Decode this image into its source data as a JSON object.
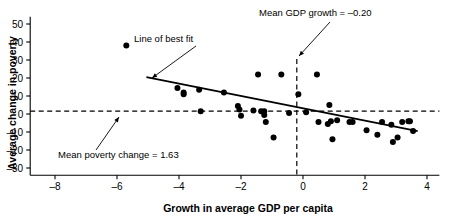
{
  "chart_data": {
    "type": "scatter",
    "title": "",
    "xlabel": "Growth in average GDP  per capita",
    "ylabel": "Average change in poverty",
    "xlim": [
      -8.8,
      4.4
    ],
    "ylim": [
      -34,
      54
    ],
    "xticks": [
      -8,
      -6,
      -4,
      -2,
      0,
      2,
      4
    ],
    "xtick_labels": [
      "–8",
      "–6",
      "–4",
      "–2",
      "0",
      "2",
      "4"
    ],
    "yticks": [
      -30,
      -20,
      -10,
      0,
      10,
      20,
      30,
      40,
      50
    ],
    "ytick_labels": [
      "–30",
      "–20",
      "–10",
      "0",
      "10",
      "20",
      "30",
      "40",
      "50"
    ],
    "grid": false,
    "legend": "none",
    "point_color": "#000000",
    "line_color": "#000000",
    "points": [
      {
        "x": -5.7,
        "y": 38.0
      },
      {
        "x": -4.05,
        "y": 14.5
      },
      {
        "x": -3.85,
        "y": 12.0
      },
      {
        "x": -3.85,
        "y": 11.0
      },
      {
        "x": -3.35,
        "y": 13.5
      },
      {
        "x": -3.3,
        "y": 1.5
      },
      {
        "x": -2.55,
        "y": 12.0
      },
      {
        "x": -2.1,
        "y": 4.5
      },
      {
        "x": -2.05,
        "y": 2.5
      },
      {
        "x": -2.0,
        "y": -1.0
      },
      {
        "x": -1.6,
        "y": 2.0
      },
      {
        "x": -1.45,
        "y": 22.0
      },
      {
        "x": -1.35,
        "y": 1.5
      },
      {
        "x": -1.25,
        "y": 1.5
      },
      {
        "x": -1.25,
        "y": -0.5
      },
      {
        "x": -1.2,
        "y": -4.5
      },
      {
        "x": -0.95,
        "y": -13.0
      },
      {
        "x": -0.7,
        "y": 22.0
      },
      {
        "x": -0.45,
        "y": 0.5
      },
      {
        "x": -0.15,
        "y": 11.0
      },
      {
        "x": 0.1,
        "y": 1.0
      },
      {
        "x": 0.45,
        "y": 22.0
      },
      {
        "x": 0.5,
        "y": -4.5
      },
      {
        "x": 0.8,
        "y": -5.5
      },
      {
        "x": 0.85,
        "y": 5.0
      },
      {
        "x": 0.9,
        "y": -4.0
      },
      {
        "x": 0.95,
        "y": -14.0
      },
      {
        "x": 1.1,
        "y": -3.5
      },
      {
        "x": 1.5,
        "y": -4.5
      },
      {
        "x": 1.6,
        "y": -4.5
      },
      {
        "x": 2.05,
        "y": -9.0
      },
      {
        "x": 2.4,
        "y": -11.5
      },
      {
        "x": 2.55,
        "y": -4.5
      },
      {
        "x": 2.85,
        "y": -6.0
      },
      {
        "x": 2.9,
        "y": -15.5
      },
      {
        "x": 3.05,
        "y": -13.0
      },
      {
        "x": 3.2,
        "y": -4.5
      },
      {
        "x": 3.4,
        "y": -4.0
      },
      {
        "x": 3.45,
        "y": -4.0
      },
      {
        "x": 3.55,
        "y": -9.5
      }
    ],
    "best_fit_line": {
      "label": "Line of best fit",
      "x_start": -5.05,
      "y_start": 20.5,
      "x_end": 3.7,
      "y_end": -9.5
    },
    "mean_gdp_growth": {
      "label": "Mean GDP growth = –0.20",
      "value": -0.2
    },
    "mean_poverty_change": {
      "label": "Mean poverty change = 1.63",
      "value": 1.63
    }
  }
}
